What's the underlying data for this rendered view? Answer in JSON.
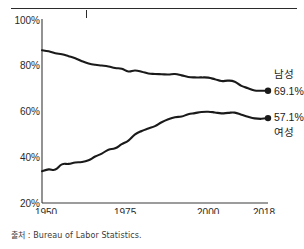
{
  "source_note": "출처 : Bureau of Labor Statistics.",
  "chart_data": {
    "type": "line",
    "title": "",
    "xlabel": "",
    "ylabel": "",
    "xlim": [
      1950,
      2018
    ],
    "ylim": [
      20,
      100
    ],
    "grid": false,
    "legend_position": "inline-right",
    "y_ticks": [
      20,
      40,
      60,
      80,
      100
    ],
    "y_tick_labels": [
      "20%",
      "40%",
      "60%",
      "80%",
      "100%"
    ],
    "x_ticks": [
      1950,
      1975,
      2000,
      2018
    ],
    "x_tick_labels": [
      "1950",
      "1975",
      "2000",
      "2018"
    ],
    "series": [
      {
        "name": "남성",
        "end_label": "69.1%",
        "color": "#1a1a1a",
        "end_value": 69.1,
        "x": [
          1950,
          1952,
          1954,
          1956,
          1958,
          1960,
          1962,
          1964,
          1966,
          1968,
          1970,
          1972,
          1974,
          1976,
          1978,
          1980,
          1982,
          1984,
          1986,
          1988,
          1990,
          1992,
          1994,
          1996,
          1998,
          2000,
          2002,
          2004,
          2006,
          2008,
          2010,
          2012,
          2014,
          2016,
          2018
        ],
        "values": [
          86.8,
          86.3,
          85.5,
          85.0,
          84.2,
          83.3,
          82.0,
          81.0,
          80.4,
          80.1,
          79.7,
          79.0,
          78.7,
          77.5,
          77.9,
          77.4,
          76.6,
          76.4,
          76.3,
          76.2,
          76.4,
          75.8,
          75.1,
          74.9,
          74.9,
          74.8,
          74.1,
          73.3,
          73.5,
          73.0,
          71.2,
          70.2,
          69.2,
          69.1,
          69.1
        ]
      },
      {
        "name": "여성",
        "end_label": "57.1%",
        "color": "#1a1a1a",
        "end_value": 57.1,
        "x": [
          1950,
          1952,
          1954,
          1956,
          1958,
          1960,
          1962,
          1964,
          1966,
          1968,
          1970,
          1972,
          1974,
          1976,
          1978,
          1980,
          1982,
          1984,
          1986,
          1988,
          1990,
          1992,
          1994,
          1996,
          1998,
          2000,
          2002,
          2004,
          2006,
          2008,
          2010,
          2012,
          2014,
          2016,
          2018
        ],
        "values": [
          33.9,
          34.7,
          34.6,
          36.9,
          37.1,
          37.7,
          37.9,
          38.7,
          40.3,
          41.6,
          43.3,
          43.9,
          45.7,
          47.3,
          50.0,
          51.5,
          52.6,
          53.6,
          55.3,
          56.6,
          57.5,
          57.8,
          58.8,
          59.3,
          59.8,
          59.9,
          59.6,
          59.2,
          59.4,
          59.5,
          58.6,
          57.7,
          57.0,
          56.8,
          57.1
        ]
      }
    ]
  }
}
